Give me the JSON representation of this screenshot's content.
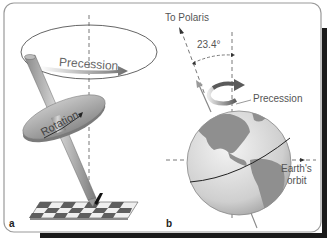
{
  "figure": {
    "panels": [
      {
        "id": "a",
        "letter": "a",
        "labels": {
          "precession": "Precession",
          "rotation": "Rotation"
        },
        "description": "Spinning top on checkerboard precessing around vertical axis"
      },
      {
        "id": "b",
        "letter": "b",
        "labels": {
          "pole_star": "To Polaris",
          "tilt_angle": "23.4°",
          "precession": "Precession",
          "orbit_line1": "Earth's",
          "orbit_line2": "orbit"
        },
        "description": "Earth tilted 23.4° with precessing axis"
      }
    ],
    "colors": {
      "frame_border": "#9a9a9a",
      "shadow": "#1a1a1a",
      "arrow_gray": "#7a7a7a",
      "globe_ocean": "#cfcfcf",
      "globe_land": "#8f8f8f",
      "top_body": "#a8a8a8",
      "checker_dark": "#5e5e5e",
      "checker_light": "#efefef"
    }
  }
}
